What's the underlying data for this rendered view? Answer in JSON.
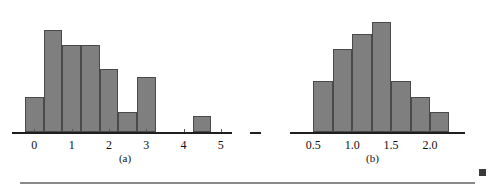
{
  "figure": {
    "background_color": "#ffffff",
    "bar_fill_color": "#7f7f7f",
    "bar_edge_color": "#4a4a4a",
    "axis_color": "#1f1f1f",
    "rule_color": "#8a8a8a",
    "marker_color": "#3a3a3a"
  },
  "panels": [
    {
      "id": "a",
      "caption": "(a)",
      "chart_index": 0
    },
    {
      "id": "b",
      "caption": "(b)",
      "chart_index": 1
    }
  ],
  "footer": {
    "rule_visible": true,
    "corner_marker_name": "page-corner-marker"
  },
  "chart_data": [
    {
      "type": "bar",
      "title": "",
      "subtitle": "",
      "xlabel": "",
      "ylabel": "",
      "caption": "(a)",
      "grid": false,
      "legend": false,
      "xlim": [
        -0.6,
        5.3
      ],
      "ylim": [
        0,
        30
      ],
      "bin_width": 0.5,
      "tick_labels": [
        "0",
        "1",
        "2",
        "3",
        "4",
        "5"
      ],
      "tick_values": [
        0,
        1,
        2,
        3,
        4,
        5
      ],
      "bin_starts": [
        -0.25,
        0.25,
        0.75,
        1.25,
        1.75,
        2.25,
        2.75,
        4.25
      ],
      "bin_labels": [
        "-0.25 to 0.25",
        "0.25 to 0.75",
        "0.75 to 1.25",
        "1.25 to 1.75",
        "1.75 to 2.25",
        "2.25 to 2.75",
        "2.75 to 3.25",
        "4.25 to 4.75"
      ],
      "values": [
        9,
        26,
        22,
        22,
        16,
        5,
        14,
        4
      ],
      "series": [
        {
          "name": "frequency",
          "values": [
            9,
            26,
            22,
            22,
            16,
            5,
            14,
            4
          ]
        }
      ]
    },
    {
      "type": "bar",
      "title": "",
      "subtitle": "",
      "xlabel": "",
      "ylabel": "",
      "caption": "(b)",
      "grid": false,
      "legend": false,
      "xlim": [
        0.2,
        2.45
      ],
      "ylim": [
        0,
        30
      ],
      "bin_width": 0.25,
      "tick_labels": [
        "0.5",
        "1.0",
        "1.5",
        "2.0"
      ],
      "tick_values": [
        0.5,
        1.0,
        1.5,
        2.0
      ],
      "bin_starts": [
        0.5,
        0.75,
        1.0,
        1.25,
        1.5,
        1.75,
        2.0
      ],
      "bin_labels": [
        "0.50 to 0.75",
        "0.75 to 1.00",
        "1.00 to 1.25",
        "1.25 to 1.50",
        "1.50 to 1.75",
        "1.75 to 2.00",
        "2.00 to 2.25"
      ],
      "values": [
        13,
        21,
        25,
        28,
        13,
        9,
        5
      ],
      "series": [
        {
          "name": "frequency",
          "values": [
            13,
            21,
            25,
            28,
            13,
            9,
            5
          ]
        }
      ]
    }
  ]
}
